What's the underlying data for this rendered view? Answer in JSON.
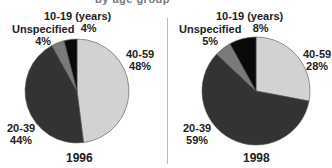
{
  "chart_data": [
    {
      "type": "pie",
      "title": "1996",
      "categories": [
        "10-19 (years)",
        "40-59",
        "20-39",
        "Unspecified"
      ],
      "values": [
        4,
        48,
        44,
        4
      ],
      "unit": "%",
      "colors": [
        "#0a0a0a",
        "#d2d2d2",
        "#333333",
        "#7a7a7a"
      ],
      "labels": {
        "c10": {
          "name": "10-19 (years)",
          "pct": "4%"
        },
        "c40": {
          "name": "40-59",
          "pct": "48%"
        },
        "c20": {
          "name": "20-39",
          "pct": "44%"
        },
        "cu": {
          "name": "Unspecified",
          "pct": "4%"
        }
      }
    },
    {
      "type": "pie",
      "title": "1998",
      "categories": [
        "10-19 (years)",
        "40-59",
        "20-39",
        "Unspecified"
      ],
      "values": [
        8,
        28,
        59,
        5
      ],
      "unit": "%",
      "colors": [
        "#0a0a0a",
        "#d2d2d2",
        "#333333",
        "#7a7a7a"
      ],
      "labels": {
        "c10": {
          "name": "10-19 (years)",
          "pct": "8%"
        },
        "c40": {
          "name": "40-59",
          "pct": "28%"
        },
        "c20": {
          "name": "20-39",
          "pct": "59%"
        },
        "cu": {
          "name": "Unspecified",
          "pct": "5%"
        }
      }
    }
  ],
  "title_fragment": "by age group"
}
